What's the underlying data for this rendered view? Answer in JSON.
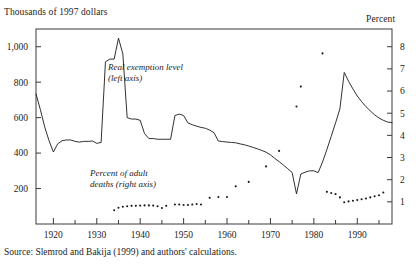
{
  "chart_data": {
    "type": "line",
    "title": "",
    "ylabel": "Thousands of 1997 dollars",
    "ylabel_right": "Percent",
    "xlabel": "",
    "xlim": [
      1916,
      1998
    ],
    "ylim": [
      0,
      1100
    ],
    "ylim_right": [
      0,
      8.8
    ],
    "grid": false,
    "legend_position": "inline-annotations",
    "yticks": [
      200,
      400,
      600,
      800,
      1000
    ],
    "ytick_labels": [
      "200",
      "400",
      "600",
      "800",
      "1,000"
    ],
    "yticks_right": [
      1,
      2,
      3,
      4,
      5,
      6,
      7,
      8
    ],
    "ytick_labels_right": [
      "1",
      "2",
      "3",
      "4",
      "5",
      "6",
      "7",
      "8"
    ],
    "xticks_major": [
      1920,
      1930,
      1940,
      1950,
      1960,
      1970,
      1980,
      1990
    ],
    "xtick_labels": [
      "1920",
      "1930",
      "1940",
      "1950",
      "1960",
      "1970",
      "1980",
      "1990"
    ],
    "xticks_minor": [
      1925,
      1935,
      1945,
      1955,
      1965,
      1975,
      1985,
      1995
    ],
    "annotations": [
      {
        "text": "Real exemption level\n(left axis)",
        "x": 1931,
        "y": 880
      },
      {
        "text": "Percent of adult\ndeaths (right axis)",
        "x": 1927,
        "y": 330
      }
    ],
    "source": "Source: Slemrod and Bakija (1999) and authors' calculations.",
    "series": [
      {
        "name": "Real exemption level",
        "axis": "left",
        "style": "solid",
        "color": "#1a1a1a",
        "x": [
          1916,
          1917,
          1918,
          1919,
          1920,
          1921,
          1922,
          1923,
          1924,
          1925,
          1926,
          1927,
          1928,
          1929,
          1930,
          1931,
          1932,
          1933,
          1934,
          1935,
          1936,
          1937,
          1938,
          1939,
          1940,
          1941,
          1942,
          1943,
          1944,
          1945,
          1946,
          1947,
          1948,
          1949,
          1950,
          1951,
          1952,
          1953,
          1954,
          1955,
          1956,
          1957,
          1958,
          1959,
          1960,
          1961,
          1962,
          1963,
          1964,
          1965,
          1966,
          1967,
          1968,
          1969,
          1970,
          1971,
          1972,
          1973,
          1974,
          1975,
          1976,
          1977,
          1978,
          1979,
          1980,
          1981,
          1982,
          1983,
          1984,
          1985,
          1986,
          1987,
          1988,
          1989,
          1990,
          1991,
          1992,
          1993,
          1994,
          1995,
          1996,
          1997,
          1998
        ],
        "y": [
          733,
          646,
          548,
          470,
          406,
          452,
          470,
          474,
          474,
          466,
          462,
          466,
          466,
          468,
          455,
          460,
          915,
          930,
          930,
          1048,
          960,
          600,
          592,
          592,
          585,
          510,
          482,
          482,
          478,
          478,
          478,
          478,
          612,
          620,
          612,
          570,
          560,
          552,
          545,
          540,
          530,
          515,
          468,
          465,
          462,
          460,
          458,
          452,
          447,
          440,
          432,
          424,
          415,
          405,
          390,
          370,
          352,
          332,
          312,
          290,
          170,
          282,
          292,
          300,
          300,
          290,
          350,
          420,
          495,
          570,
          650,
          855,
          805,
          762,
          722,
          690,
          662,
          638,
          616,
          598,
          585,
          575,
          572
        ]
      },
      {
        "name": "Percent of adult deaths",
        "axis": "right",
        "style": "dotted",
        "color": "#1a1a1a",
        "x": [
          1934,
          1935,
          1936,
          1937,
          1938,
          1939,
          1940,
          1941,
          1942,
          1943,
          1944,
          1945,
          1946,
          1948,
          1949,
          1950,
          1951,
          1952,
          1953,
          1954,
          1956,
          1958,
          1960,
          1962,
          1965,
          1969,
          1972,
          1976,
          1977,
          1982,
          1983,
          1984,
          1985,
          1986,
          1987,
          1988,
          1989,
          1990,
          1991,
          1992,
          1993,
          1994,
          1995,
          1996
        ],
        "y": [
          0.62,
          0.73,
          0.78,
          0.8,
          0.82,
          0.82,
          0.83,
          0.84,
          0.84,
          0.83,
          0.8,
          0.72,
          0.82,
          0.88,
          0.88,
          0.86,
          0.86,
          0.88,
          0.9,
          0.88,
          1.18,
          1.22,
          1.22,
          1.7,
          1.9,
          2.6,
          3.3,
          5.3,
          6.2,
          7.7,
          1.45,
          1.4,
          1.35,
          1.2,
          0.98,
          1.02,
          1.05,
          1.08,
          1.12,
          1.15,
          1.2,
          1.25,
          1.3,
          1.42
        ]
      }
    ]
  },
  "plot_frame": {
    "left": 36,
    "top": 29,
    "right": 392,
    "bottom": 224
  }
}
